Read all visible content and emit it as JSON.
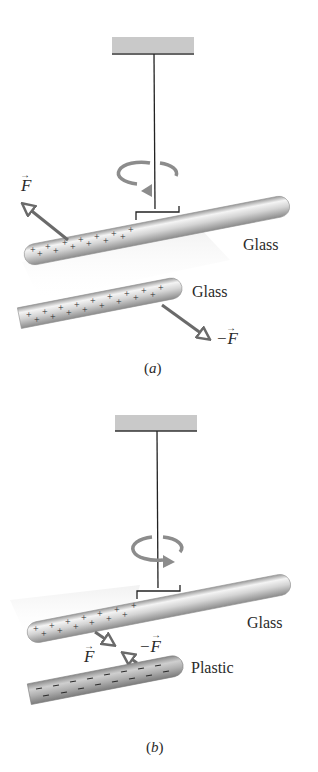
{
  "figure": {
    "panels": [
      {
        "id": "a",
        "caption": "(a)",
        "rotation_direction": "counterclockwise-left",
        "suspended_rod": {
          "label": "Glass",
          "charge_symbol": "+",
          "charge_sign": "positive"
        },
        "second_rod": {
          "label": "Glass",
          "charge_symbol": "+",
          "charge_sign": "positive"
        },
        "forces": [
          {
            "label": "F",
            "vector": true,
            "on": "suspended rod",
            "direction": "up-left (repulsion)"
          },
          {
            "label": "−F",
            "vector": true,
            "on": "second rod",
            "direction": "down-right (repulsion)"
          }
        ],
        "interaction": "repel"
      },
      {
        "id": "b",
        "caption": "(b)",
        "rotation_direction": "clockwise-right",
        "suspended_rod": {
          "label": "Glass",
          "charge_symbol": "+",
          "charge_sign": "positive"
        },
        "second_rod": {
          "label": "Plastic",
          "charge_symbol": "−",
          "charge_sign": "negative"
        },
        "forces": [
          {
            "label": "F",
            "vector": true,
            "on": "suspended rod",
            "direction": "down-right (attraction)"
          },
          {
            "label": "−F",
            "vector": true,
            "on": "second rod",
            "direction": "up-left (attraction)"
          }
        ],
        "interaction": "attract"
      }
    ],
    "labels": {
      "a_rod1": "Glass",
      "a_rod2": "Glass",
      "a_force1": "F",
      "a_force2": "−F",
      "a_caption_open": "(",
      "a_caption_letter": "a",
      "a_caption_close": ")",
      "b_rod1": "Glass",
      "b_rod2": "Plastic",
      "b_force1": "F",
      "b_force2": "−F",
      "b_caption_open": "(",
      "b_caption_letter": "b",
      "b_caption_close": ")"
    },
    "colors": {
      "rod_fill": "#c8c8c8",
      "rod_highlight": "#f2f2f2",
      "rod_shadow": "#8a8a8a",
      "plastic_fill": "#a9a9a9",
      "ceiling_fill": "#c9c9c9",
      "thread": "#222222",
      "arrow": "#6a6a6a",
      "rotation_arrow": "#8c8c8c",
      "text": "#2a2a2a"
    }
  }
}
